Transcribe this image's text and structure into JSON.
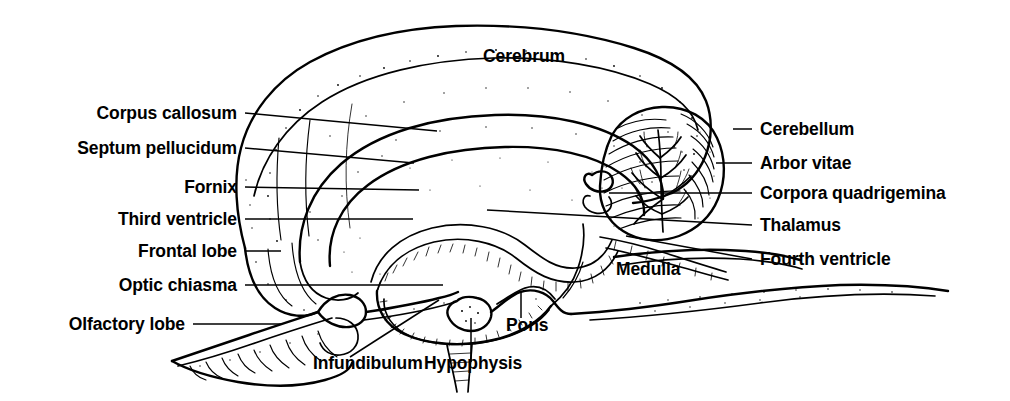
{
  "figure": {
    "background_color": "#ffffff",
    "ink_color": "#000000",
    "width": 1010,
    "height": 401
  },
  "labels": {
    "cerebrum": "Cerebrum",
    "corpus_callosum": "Corpus callosum",
    "septum_pellucidum": "Septum pellucidum",
    "fornix": "Fornix",
    "third_ventricle": "Third ventricle",
    "frontal_lobe": "Frontal lobe",
    "optic_chiasma": "Optic chiasma",
    "olfactory_lobe": "Olfactory lobe",
    "cerebellum": "Cerebellum",
    "arbor_vitae": "Arbor vitae",
    "corpora_quadrigemina": "Corpora quadrigemina",
    "thalamus": "Thalamus",
    "fourth_ventricle": "Fourth ventricle",
    "medulla": "Medulla",
    "pons": "Pons",
    "infundibulum": "Infundibulum",
    "hypophysis": "Hypophysis"
  },
  "label_positions": {
    "cerebrum": {
      "x": 524,
      "y": 62,
      "align": "center"
    },
    "corpus_callosum": {
      "x": 237,
      "y": 119,
      "align": "end"
    },
    "septum_pellucidum": {
      "x": 237,
      "y": 154,
      "align": "end"
    },
    "fornix": {
      "x": 237,
      "y": 193,
      "align": "end"
    },
    "third_ventricle": {
      "x": 237,
      "y": 225,
      "align": "end"
    },
    "frontal_lobe": {
      "x": 237,
      "y": 257,
      "align": "end"
    },
    "optic_chiasma": {
      "x": 237,
      "y": 291,
      "align": "end"
    },
    "olfactory_lobe": {
      "x": 185,
      "y": 330,
      "align": "end"
    },
    "cerebellum": {
      "x": 760,
      "y": 135,
      "align": "start"
    },
    "arbor_vitae": {
      "x": 760,
      "y": 169,
      "align": "start"
    },
    "corpora_quadrigemina": {
      "x": 760,
      "y": 199,
      "align": "start"
    },
    "thalamus": {
      "x": 760,
      "y": 231,
      "align": "start"
    },
    "fourth_ventricle": {
      "x": 760,
      "y": 265,
      "align": "start"
    },
    "medulla": {
      "x": 616,
      "y": 275,
      "align": "start"
    },
    "pons": {
      "x": 506,
      "y": 331,
      "align": "start"
    },
    "infundibulum": {
      "x": 313,
      "y": 369,
      "align": "start"
    },
    "hypophysis": {
      "x": 424,
      "y": 369,
      "align": "start"
    }
  },
  "leader_lines": {
    "corpus_callosum": "M245,113 L437,131",
    "septum_pellucidum": "M245,148 L414,163",
    "fornix": "M245,187 L419,190",
    "third_ventricle": "M245,219 L413,219",
    "frontal_lobe": "M245,251 L281,251",
    "optic_chiasma": "M245,285 L443,285",
    "olfactory_lobe": "M193,324 L281,324",
    "cerebellum": "M733,129 L752,129",
    "arbor_vitae": "M716,163 L752,163",
    "corpora_quadrigemina": "M609,193 L752,193",
    "thalamus": "M487,210 L752,225",
    "fourth_ventricle": "M626,236 L752,259",
    "pons": "M521,292 L521,318",
    "infundibulum": "M350,357 L439,300",
    "hypophysis": "M471,362 L471,318"
  }
}
